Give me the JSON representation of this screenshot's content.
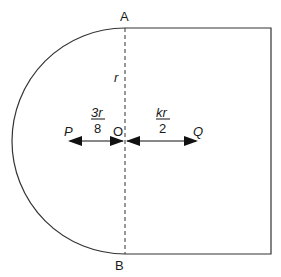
{
  "diagram": {
    "points": {
      "A": "A",
      "B": "B",
      "O": "O",
      "P": "P",
      "Q": "Q"
    },
    "radius_label": "r",
    "left_distance": {
      "numerator": "3r",
      "denominator": "8"
    },
    "right_distance": {
      "numerator": "kr",
      "denominator": "2"
    },
    "colors": {
      "stroke": "#333333",
      "text": "#1a1a1a"
    }
  }
}
